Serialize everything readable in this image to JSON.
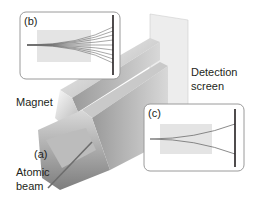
{
  "diagram": {
    "labels": {
      "panel_b": "(b)",
      "panel_c": "(c)",
      "panel_a": "(a)",
      "magnet": "Magnet",
      "detection_line1": "Detection",
      "detection_line2": "screen",
      "atomic_line1": "Atomic",
      "atomic_line2": "beam"
    },
    "colors": {
      "panel_border": "#9a9a9a",
      "field_region": "#e4e4e4",
      "beam": "#6d6d6d",
      "screen_bar": "#231f20",
      "detection_screen": "#ededed",
      "magnet_light": "#e6e6e6",
      "magnet_dark": "#8a8a8a",
      "text": "#231f20"
    },
    "panel_b": {
      "trajectories": 9,
      "description": "continuous spread of beam (classical expectation)"
    },
    "panel_c": {
      "trajectories": 2,
      "description": "beam splits into two (observed result)"
    }
  }
}
